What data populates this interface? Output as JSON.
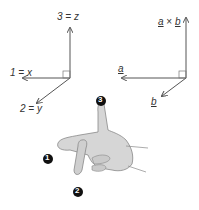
{
  "left_axes": {
    "z_label": "3 = z",
    "x_label": "1 = x",
    "y_label": "2 = y"
  },
  "right_axes": {
    "cross_label_a": "a",
    "cross_label_times": "×",
    "cross_label_b": "b",
    "a_label": "a",
    "b_label": "b"
  },
  "hand": {
    "badges": [
      "1",
      "2",
      "3"
    ]
  },
  "colors": {
    "axis": "#555555",
    "hand_fill": "#d6d6d6",
    "hand_stroke": "#888888",
    "badge": "#111111"
  }
}
